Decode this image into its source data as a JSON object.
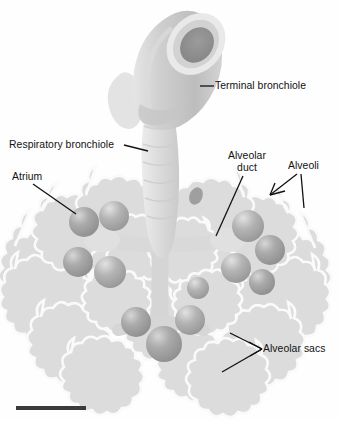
{
  "figure": {
    "background_color": "#fefefe",
    "ink_color": "#121212",
    "scale_bar": {
      "present": true,
      "color": "#3a3a3a",
      "width_px": 70
    }
  },
  "labels": {
    "terminal_bronchiole": "Terminal bronchiole",
    "respiratory_bronchiole": "Respiratory bronchiole",
    "atrium": "Atrium",
    "alveolar_duct_line1": "Alveolar",
    "alveolar_duct_line2": "duct",
    "alveoli": "Alveoli",
    "alveolar_sacs": "Alveolar sacs"
  },
  "structures": {
    "terminal_bronchiole": {
      "name": "terminal-bronchiole",
      "description": "Cut cylindrical airway with open lumen at upper right",
      "wall_color": "#c9c9c9",
      "lumen_color": "#9a9a9a",
      "rim_color": "#e8e8e8"
    },
    "respiratory_bronchiole": {
      "name": "respiratory-bronchiole",
      "description": "Ribbed descending tube below terminal bronchiole",
      "color": "#dedede"
    },
    "alveolar_duct": {
      "name": "alveolar-duct",
      "description": "Pale branching ducts radiating from central stem",
      "color": "#d8d8d8"
    },
    "atrium": {
      "name": "atrium",
      "description": "Expanded chamber where alveolar duct meets alveolar sacs",
      "color": "#cfcfcf"
    },
    "alveolar_sacs": {
      "name": "alveolar-sac",
      "description": "Grey spherical sacs clustered at duct terminations",
      "color": "#a6a6a6",
      "count": 12
    },
    "alveoli": {
      "name": "alveoli",
      "description": "Pale lobed grape-like clusters forming the outer mass",
      "color": "#dcdcdc",
      "outline_color": "#f7f7f7"
    }
  },
  "leaders": {
    "terminal_bronchiole": {
      "type": "straight"
    },
    "respiratory_bronchiole": {
      "type": "straight"
    },
    "atrium": {
      "type": "straight"
    },
    "alveolar_duct": {
      "type": "straight"
    },
    "alveoli": {
      "type": "forked",
      "branches": 2
    },
    "alveolar_sacs": {
      "type": "forked",
      "branches": 2
    }
  }
}
